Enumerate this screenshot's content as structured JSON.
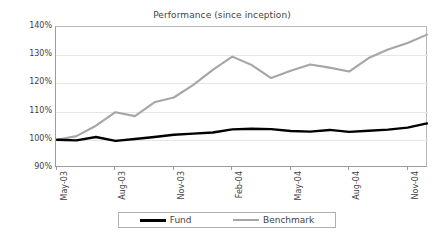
{
  "chart_data": {
    "type": "line",
    "title": "Performance (since inception)",
    "xlabel": "",
    "ylabel": "",
    "ylim": [
      90,
      140
    ],
    "ytick_labels": [
      "140%",
      "130%",
      "120%",
      "110%",
      "100%",
      "90%"
    ],
    "ytick_values": [
      140,
      130,
      120,
      110,
      100,
      90
    ],
    "grid": true,
    "legend_position": "bottom",
    "x_tick_labels": [
      "May-03",
      "Aug-03",
      "Nov-03",
      "Feb-04",
      "May-04",
      "Aug-04",
      "Nov-04"
    ],
    "x_tick_indices": [
      0,
      3,
      6,
      9,
      12,
      15,
      18
    ],
    "x": [
      "May-03",
      "Jun-03",
      "Jul-03",
      "Aug-03",
      "Sep-03",
      "Oct-03",
      "Nov-03",
      "Dec-03",
      "Jan-04",
      "Feb-04",
      "Mar-04",
      "Apr-04",
      "May-04",
      "Jun-04",
      "Jul-04",
      "Aug-04",
      "Sep-04",
      "Oct-04",
      "Nov-04",
      "Dec-04"
    ],
    "series": [
      {
        "name": "Fund",
        "color": "#000000",
        "values": [
          100.0,
          99.8,
          101.0,
          99.6,
          100.3,
          101.0,
          101.8,
          102.2,
          102.6,
          103.7,
          103.9,
          103.8,
          103.1,
          102.9,
          103.5,
          102.8,
          103.2,
          103.6,
          104.3,
          105.8
        ]
      },
      {
        "name": "Benchmark",
        "color": "#a6a6a6",
        "values": [
          100.0,
          101.3,
          105.0,
          109.8,
          108.4,
          113.3,
          115.0,
          119.5,
          124.8,
          129.5,
          126.5,
          121.9,
          124.5,
          126.7,
          125.6,
          124.2,
          129.0,
          132.0,
          134.3,
          137.3
        ]
      }
    ]
  },
  "legend": {
    "items": [
      {
        "label": "Fund"
      },
      {
        "label": "Benchmark"
      }
    ]
  }
}
